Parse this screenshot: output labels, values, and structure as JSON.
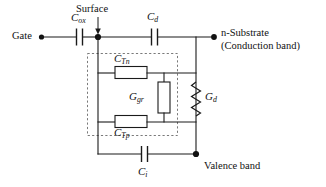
{
  "diagram": {
    "type": "circuit-schematic",
    "colors": {
      "wire": "#1a1a1a",
      "dashed_box": "#7a7a7a",
      "background": "#ffffff"
    }
  },
  "terminals": {
    "gate": {
      "label": "Gate",
      "x": 24,
      "y": 31
    },
    "substrate": {
      "line1": "n-Substrate",
      "line2": "(Conduction band)",
      "x": 222,
      "y": 27
    },
    "valence": {
      "label": "Valence band",
      "x": 205,
      "y": 160
    },
    "surface": {
      "label": "Surface",
      "x": 76,
      "y": 4
    }
  },
  "components": [
    {
      "id": "c-ox",
      "kind": "capacitor",
      "symbol": "C",
      "subscript": "ox",
      "label": "C_ox",
      "label_x": 72,
      "label_y": 14,
      "orientation": "horizontal"
    },
    {
      "id": "c-d",
      "kind": "capacitor",
      "symbol": "C",
      "subscript": "d",
      "label": "C_d",
      "label_x": 146,
      "label_y": 13,
      "orientation": "horizontal"
    },
    {
      "id": "c-tn",
      "kind": "box-capacitor",
      "symbol": "C",
      "subscript": "Tn",
      "label": "C_Tn",
      "label_x": 114,
      "label_y": 56,
      "orientation": "horizontal"
    },
    {
      "id": "c-tp",
      "kind": "box-capacitor",
      "symbol": "C",
      "subscript": "Tp",
      "label": "C_Tp",
      "label_x": 114,
      "label_y": 126,
      "orientation": "horizontal"
    },
    {
      "id": "g-gr",
      "kind": "box-conductance",
      "symbol": "G",
      "subscript": "gr",
      "label": "G_gr",
      "label_x": 131,
      "label_y": 91,
      "orientation": "vertical"
    },
    {
      "id": "g-d",
      "kind": "zigzag-conductance",
      "symbol": "G",
      "subscript": "d",
      "label": "G_d",
      "label_x": 205,
      "label_y": 91,
      "orientation": "vertical"
    },
    {
      "id": "c-i",
      "kind": "capacitor",
      "symbol": "C",
      "subscript": "i",
      "label": "C_i",
      "label_x": 140,
      "label_y": 165,
      "orientation": "horizontal"
    }
  ],
  "annotations": {
    "dashed_group": {
      "name": "interface-trap-group",
      "x": 87,
      "y": 53,
      "width": 91,
      "height": 83
    },
    "surface_arrow": {
      "from_y": 17,
      "to_y": 34,
      "x": 98
    }
  }
}
